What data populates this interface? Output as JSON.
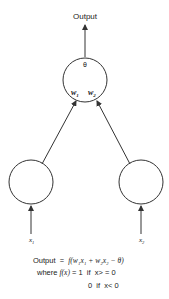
{
  "diagram": {
    "output_label": "Output",
    "threshold_label": "θ",
    "weights": [
      "w",
      "w"
    ],
    "weight_subscripts": [
      "1",
      "2"
    ],
    "inputs": [
      {
        "name": "x",
        "sub": "1"
      },
      {
        "name": "x",
        "sub": "2"
      }
    ],
    "equation": {
      "line1_prefix": "Output  =  ",
      "line1_func": "f",
      "line1_body": "(w₁x₁ + w₂x₂ − θ)",
      "line2_prefix": "where ",
      "line2_func": "f(x)",
      "line2_rest": " = 1  if  x> = 0",
      "line3": "0  if  x< 0"
    },
    "colors": {
      "stroke": "#333333",
      "text": "#222222"
    }
  }
}
